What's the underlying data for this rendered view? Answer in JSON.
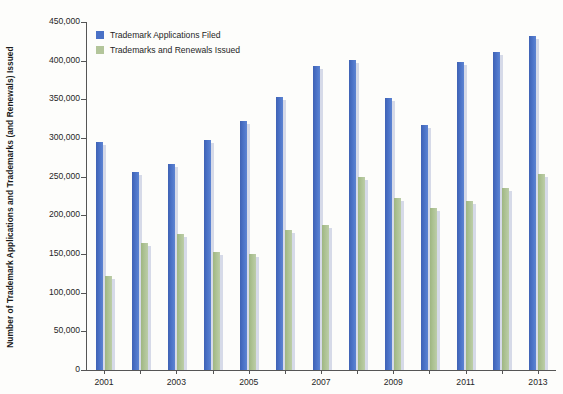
{
  "chart_data": {
    "type": "bar",
    "title": "",
    "xlabel": "",
    "ylabel": "Number of Trademark Applications and Trademarks (and Renewals) Issued",
    "ylim": [
      0,
      450000
    ],
    "ytick_values": [
      0,
      50000,
      100000,
      150000,
      200000,
      250000,
      300000,
      350000,
      400000,
      450000
    ],
    "ytick_labels": [
      "0",
      "50,000",
      "100,000",
      "150,000",
      "200,000",
      "250,000",
      "300,000",
      "350,000",
      "400,000",
      "450,000"
    ],
    "categories": [
      "2001",
      "2002",
      "2003",
      "2004",
      "2005",
      "2006",
      "2007",
      "2008",
      "2009",
      "2010",
      "2011",
      "2012",
      "2013"
    ],
    "xtick_labels_shown": [
      "2001",
      "2003",
      "2005",
      "2007",
      "2009",
      "2011",
      "2013"
    ],
    "grid": false,
    "legend_position": "top-left",
    "series": [
      {
        "name": "Trademark Applications Filed",
        "color": "#4a71c6",
        "values": [
          295000,
          256000,
          266000,
          297000,
          322000,
          353000,
          393000,
          401000,
          352000,
          317000,
          398000,
          411000,
          432000
        ]
      },
      {
        "name": "Trademarks and Renewals Issued",
        "color": "#b3c59a",
        "values": [
          122000,
          164000,
          176000,
          152000,
          150000,
          181000,
          188000,
          250000,
          222000,
          210000,
          219000,
          235000,
          254000
        ]
      }
    ]
  }
}
